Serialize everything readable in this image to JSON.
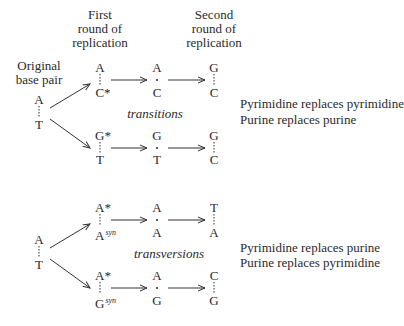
{
  "headers": {
    "first": [
      "First",
      "round of",
      "replication"
    ],
    "second": [
      "Second",
      "round of",
      "replication"
    ],
    "original": [
      "Original",
      "base pair"
    ]
  },
  "transitions": {
    "original": {
      "top": "A",
      "bottom": "T"
    },
    "label": "transitions",
    "paths": [
      {
        "first": {
          "top": "A",
          "bottom": "C*"
        },
        "intermediate": {
          "top": "A",
          "bottom": "C"
        },
        "second": {
          "top": "G",
          "bottom": "C"
        }
      },
      {
        "first": {
          "top": "G*",
          "bottom": "T"
        },
        "intermediate": {
          "top": "G",
          "bottom": "T"
        },
        "second": {
          "top": "G",
          "bottom": "C"
        }
      }
    ],
    "description": [
      "Pyrimidine replaces pyrimidine",
      "Purine replaces purine"
    ]
  },
  "transversions": {
    "original": {
      "top": "A",
      "bottom": "T"
    },
    "label": "transversions",
    "paths": [
      {
        "first": {
          "top": "A*",
          "bottom": "A",
          "bottom_sup": "syn"
        },
        "intermediate": {
          "top": "A",
          "bottom": "A"
        },
        "second": {
          "top": "T",
          "bottom": "A"
        }
      },
      {
        "first": {
          "top": "A*",
          "bottom": "G",
          "bottom_sup": "syn"
        },
        "intermediate": {
          "top": "A",
          "bottom": "G"
        },
        "second": {
          "top": "C",
          "bottom": "G"
        }
      }
    ],
    "description": [
      "Pyrimidine replaces purine",
      "Purine replaces pyrimidine"
    ]
  },
  "colors": {
    "text": "#2a2a2a",
    "line": "#333333"
  }
}
